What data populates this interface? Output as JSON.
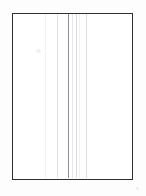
{
  "document": {
    "kind": "scanned-blank-form-page",
    "page_label": "",
    "background_color": "#fdfdfd",
    "page_color": "#ffffff",
    "frame": {
      "label": "form-border",
      "color": "#2e2e30",
      "stroke_width_px": 1.1,
      "left_px": 12,
      "top_px": 12.5,
      "width_px": 121,
      "height_px": 167
    },
    "column_rules": [
      {
        "name": "rule-1",
        "x_px": 45.0,
        "color": "#f2f2f3",
        "width_px": 1
      },
      {
        "name": "rule-2",
        "x_px": 57.0,
        "color": "#e2e2e4",
        "width_px": 1
      },
      {
        "name": "rule-3",
        "x_px": 68.0,
        "color": "#8e8e92",
        "width_px": 1
      },
      {
        "name": "rule-4",
        "x_px": 72.0,
        "color": "#e6e6e8",
        "width_px": 1
      },
      {
        "name": "rule-5",
        "x_px": 75.5,
        "color": "#dcdcde",
        "width_px": 1
      },
      {
        "name": "rule-6",
        "x_px": 79.0,
        "color": "#f1f1f2",
        "width_px": 1
      },
      {
        "name": "rule-7",
        "x_px": 86.0,
        "color": "#dedee0",
        "width_px": 1
      }
    ],
    "marks": [
      {
        "name": "scan-smudge",
        "x_px": 36,
        "y_px": 49,
        "w_px": 5,
        "h_px": 4,
        "color": "#f0f0f2"
      },
      {
        "name": "corner-speck",
        "x_px": 136,
        "y_px": 187,
        "w_px": 3,
        "h_px": 3,
        "color": "#ececed"
      }
    ]
  }
}
